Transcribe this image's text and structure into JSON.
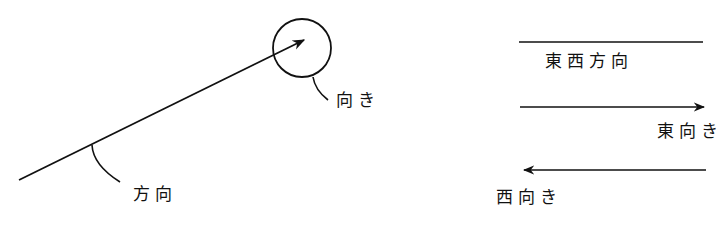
{
  "diagram": {
    "left_panel": {
      "direction_label": "方向",
      "orientation_label": "向き"
    },
    "right_panel": {
      "line_label": "東西方向",
      "east_arrow_label": "東向き",
      "west_arrow_label": "西向き"
    },
    "colors": {
      "stroke": "#111111",
      "background": "#ffffff"
    }
  }
}
